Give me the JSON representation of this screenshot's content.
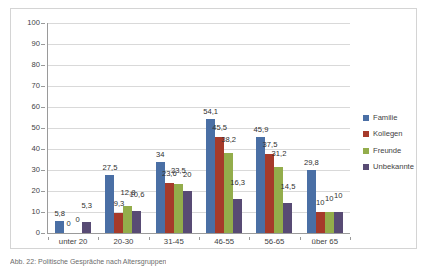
{
  "chart_data": {
    "type": "bar",
    "title": "",
    "xlabel": "",
    "ylabel": "",
    "ylim": [
      0,
      100
    ],
    "ytick_step": 10,
    "yticks": [
      "100",
      "90",
      "80",
      "70",
      "60",
      "50",
      "40",
      "30",
      "20",
      "10",
      "0"
    ],
    "grid": true,
    "legend_position": "right",
    "categories": [
      "unter 20",
      "20-30",
      "31-45",
      "46-55",
      "56-65",
      "über 65"
    ],
    "series": [
      {
        "name": "Familie",
        "color": "#4a6fa5",
        "values": [
          5.8,
          27.5,
          34,
          54.1,
          45.9,
          29.8
        ],
        "labels": [
          "5,8",
          "27,5",
          "34",
          "54,1",
          "45,9",
          "29,8"
        ]
      },
      {
        "name": "Kollegen",
        "color": "#a63a2a",
        "values": [
          0,
          9.3,
          23.6,
          45.5,
          37.5,
          10
        ],
        "labels": [
          "0",
          "9,3",
          "23,6",
          "45,5",
          "37,5",
          "10"
        ]
      },
      {
        "name": "Freunde",
        "color": "#93ad4b",
        "values": [
          0,
          12.8,
          23.5,
          38.2,
          31.2,
          10
        ],
        "labels": [
          "0",
          "12,8",
          "23,5",
          "38,2",
          "31,2",
          "10"
        ]
      },
      {
        "name": "Unbekannte",
        "color": "#584b74",
        "values": [
          5.3,
          10.6,
          20,
          16.3,
          14.5,
          10
        ],
        "labels": [
          "5,3",
          "10,6",
          "20",
          "16,3",
          "14,5",
          "10"
        ]
      }
    ]
  },
  "legend": {
    "items": [
      {
        "label": "Familie",
        "color": "#4a6fa5"
      },
      {
        "label": "Kollegen",
        "color": "#a63a2a"
      },
      {
        "label": "Freunde",
        "color": "#93ad4b"
      },
      {
        "label": "Unbekannte",
        "color": "#584b74"
      }
    ]
  },
  "caption": {
    "text": "Abb. 22: Politische Gespräche nach Altersgruppen"
  }
}
